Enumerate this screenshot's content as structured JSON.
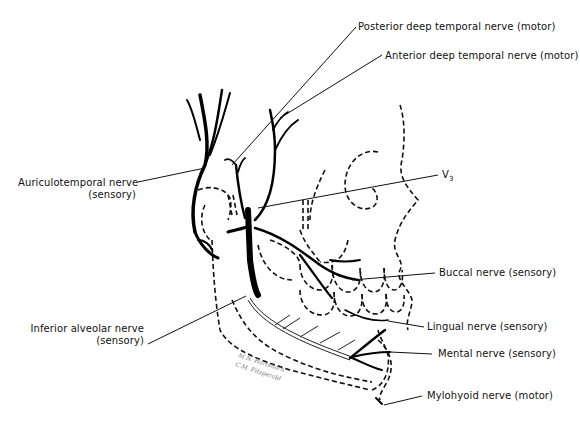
{
  "figure": {
    "type": "anatomical line drawing",
    "colors": {
      "nerve": "#000000",
      "outline": "#111111",
      "background": "#ffffff"
    }
  },
  "labels": [
    {
      "id": "posterior-deep-temporal",
      "text": "Posterior deep temporal nerve (motor)"
    },
    {
      "id": "anterior-deep-temporal",
      "text": "Anterior deep temporal nerve (motor)"
    },
    {
      "id": "auriculotemporal",
      "text": "Auriculotemporal nerve",
      "sub": "(sensory)"
    },
    {
      "id": "v3",
      "text": "V",
      "subscript": "3"
    },
    {
      "id": "buccal",
      "text": "Buccal nerve (sensory)"
    },
    {
      "id": "inferior-alveolar",
      "text": "Inferior alveolar nerve",
      "sub": "(sensory)"
    },
    {
      "id": "lingual",
      "text": "Lingual nerve (sensory)"
    },
    {
      "id": "mental",
      "text": "Mental nerve (sensory)"
    },
    {
      "id": "mylohyoid",
      "text": "Mylohyoid nerve (motor)"
    }
  ],
  "signature": {
    "line1": "M.N. Hartshorn",
    "line2": "C.M. Fitzgerald"
  }
}
